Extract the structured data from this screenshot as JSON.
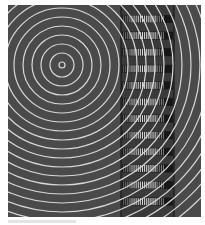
{
  "figure": {
    "background_color": "#4a4a4a",
    "ring_color": "#d8d8d8",
    "rings": {
      "center_x": 54,
      "center_y": 60,
      "count": 22,
      "spacing": 9,
      "first_radius": 3
    },
    "stripe_column": {
      "x": 113,
      "width": 53,
      "rows": 12,
      "row_start_y": 10,
      "row_pitch": 16.6,
      "row_height": 8,
      "frame_color": "#111111"
    }
  },
  "caption": {
    "text": ""
  }
}
